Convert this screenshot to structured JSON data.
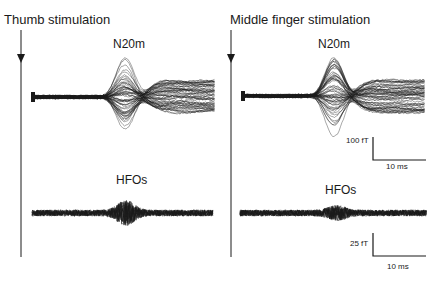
{
  "figure": {
    "panels": [
      {
        "title": "Thumb stimulation",
        "n20m_label": "N20m",
        "hfo_label": "HFOs"
      },
      {
        "title": "Middle finger stimulation",
        "n20m_label": "N20m",
        "hfo_label": "HFOs",
        "scale_bar_top": {
          "amplitude": "100 fT",
          "time": "10 ms"
        },
        "scale_bar_bottom": {
          "amplitude": "25 fT",
          "time": "10 ms"
        }
      }
    ],
    "colors": {
      "trace": "#1a1a1a",
      "background": "#ffffff"
    }
  }
}
